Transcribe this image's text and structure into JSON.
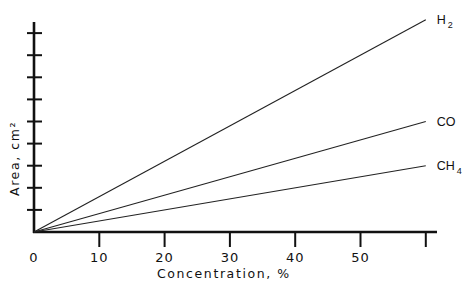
{
  "chart_data": {
    "type": "line",
    "title": "",
    "xlabel": "Concentration, %",
    "ylabel": "Area, cm²",
    "xlim": [
      0,
      60
    ],
    "ylim": [
      0,
      9.5
    ],
    "x_ticks": [
      0,
      10,
      20,
      30,
      40,
      50,
      60
    ],
    "x_tick_labels": [
      "0",
      "10",
      "20",
      "30",
      "40",
      "50",
      ""
    ],
    "y_ticks": [
      1,
      2,
      3,
      4,
      5,
      6,
      7,
      8,
      9
    ],
    "y_tick_labels": [
      "",
      "",
      "",
      "",
      "",
      "",
      "",
      "",
      ""
    ],
    "grid": false,
    "legend": "inline labels at line ends",
    "x": [
      0,
      60
    ],
    "series": [
      {
        "name": "H2",
        "label_main": "H",
        "label_sub": "2",
        "values": [
          0,
          9.6
        ]
      },
      {
        "name": "CO",
        "label_main": "CO",
        "label_sub": "",
        "values": [
          0,
          5.0
        ]
      },
      {
        "name": "CH4",
        "label_main": "CH",
        "label_sub": "4",
        "values": [
          0,
          3.0
        ]
      }
    ],
    "colors": {
      "axis": "#111111",
      "line": "#222222",
      "background": "#ffffff"
    }
  }
}
